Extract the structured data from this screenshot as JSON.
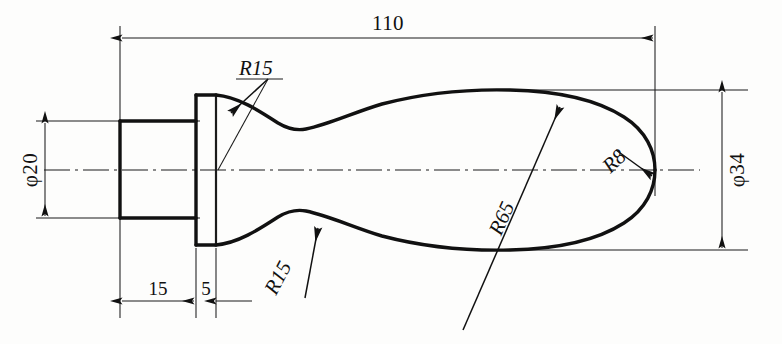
{
  "drawing": {
    "title": "Handle / Knob Turning Part Profile",
    "units": "mm",
    "projection": "front-view-half-section",
    "line_color": "#111111",
    "background_color": "#fdfdfc"
  },
  "dimensions": {
    "overall_length": "110",
    "shank_diameter": "φ20",
    "body_diameter": "φ34",
    "shank_length": "15",
    "flange_width": "5"
  },
  "radii": {
    "upper_neck": "R15",
    "lower_neck": "R15",
    "body_flank": "R65",
    "nose_tip": "R8"
  },
  "labels": {
    "overall_length": "110",
    "shank_diameter": "φ20",
    "body_diameter": "φ34",
    "shank_length": "15",
    "flange_width": "5",
    "upper_neck_radius": "R15",
    "lower_neck_radius": "R15",
    "body_flank_radius": "R65",
    "nose_tip_radius": "R8"
  },
  "geometry_notes": {
    "centerline_y": "170",
    "left_datum_x": "120",
    "flange_left_x": "196",
    "flange_right_x": "216",
    "nose_tip_x": "655",
    "shank_top_y": "121",
    "shank_bottom_y": "218",
    "body_top_y": "90",
    "body_bottom_y": "250"
  }
}
